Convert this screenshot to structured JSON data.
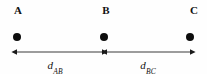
{
  "figure": {
    "background_color": "#fefefe",
    "ink_color": "#111111",
    "points": [
      {
        "label": "A",
        "label_x": 18,
        "label_y": 5,
        "dot_x": 17,
        "dot_y": 37
      },
      {
        "label": "B",
        "label_x": 106,
        "label_y": 5,
        "dot_x": 104,
        "dot_y": 37
      },
      {
        "label": "C",
        "label_x": 194,
        "label_y": 5,
        "dot_x": 190,
        "dot_y": 37
      }
    ],
    "dimensions": [
      {
        "name": "d-ab",
        "symbol": "d",
        "subscript": "AB",
        "label_x": 55,
        "label_y": 60,
        "start_x": 17,
        "end_x": 102,
        "line_y": 52
      },
      {
        "name": "d-bc",
        "symbol": "d",
        "subscript": "BC",
        "label_x": 148,
        "label_y": 60,
        "start_x": 107,
        "end_x": 190,
        "line_y": 52
      }
    ]
  }
}
